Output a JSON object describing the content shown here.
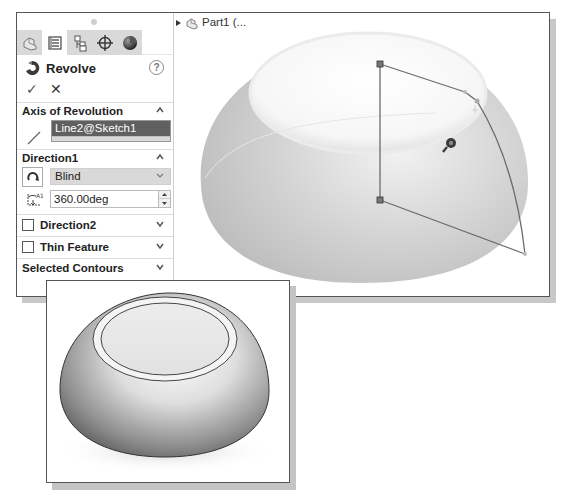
{
  "property_manager": {
    "tabs": [
      {
        "name": "feature-manager-tab",
        "icon": "part-icon",
        "active": false
      },
      {
        "name": "property-manager-tab",
        "icon": "list-icon",
        "active": true
      },
      {
        "name": "configuration-manager-tab",
        "icon": "configuration-icon",
        "active": false
      },
      {
        "name": "dimxpert-manager-tab",
        "icon": "crosshair-icon",
        "active": false
      },
      {
        "name": "display-manager-tab",
        "icon": "appearance-sphere-icon",
        "active": false
      }
    ],
    "title": "Revolve",
    "help_label": "?",
    "ok_label": "✓",
    "cancel_label": "✕",
    "sections": {
      "axis": {
        "label": "Axis of Revolution",
        "value": "Line2@Sketch1",
        "expanded": true
      },
      "direction1": {
        "label": "Direction1",
        "type": "Blind",
        "angle": "360.00deg",
        "expanded": true
      },
      "direction2": {
        "label": "Direction2",
        "checked": false,
        "expanded": false
      },
      "thin_feature": {
        "label": "Thin Feature",
        "checked": false,
        "expanded": false
      },
      "selected_contours": {
        "label": "Selected Contours",
        "expanded": false
      }
    }
  },
  "feature_tree": {
    "item_label": "Part1  (..."
  },
  "colors": {
    "selection_highlight": "#606060",
    "sketch_line": "#6b6b6b",
    "bowl_shade": "#c8c8c8"
  }
}
